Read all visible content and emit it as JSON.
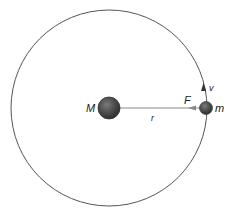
{
  "diagram": {
    "labels": {
      "central_mass": "M",
      "orbiting_mass": "m",
      "radius": "r",
      "force": "F",
      "velocity": "v"
    },
    "colors": {
      "orbit": "#555555",
      "mass_fill": "#4a4a4a",
      "line": "#777777",
      "text": "#222222"
    },
    "geometry": {
      "orbit_center": [
        109,
        108
      ],
      "orbit_radius": 98,
      "central_mass_radius": 11,
      "orbiting_mass_radius": 6.5
    }
  }
}
